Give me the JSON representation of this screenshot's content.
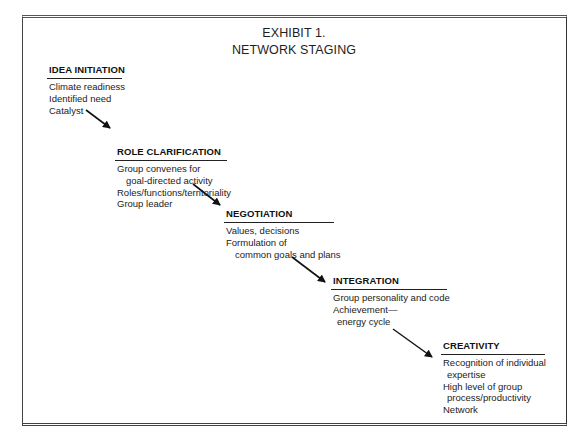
{
  "exhibit": {
    "title_line1": "EXHIBIT 1.",
    "title_line2": "NETWORK STAGING"
  },
  "stages": [
    {
      "heading": "IDEA INITIATION",
      "lines": [
        "Climate readiness",
        "Identified need",
        "Catalyst"
      ]
    },
    {
      "heading": "ROLE CLARIFICATION",
      "lines": [
        "Group convenes for",
        "goal-directed activity",
        "Roles/functions/territoriality",
        "Group leader"
      ]
    },
    {
      "heading": "NEGOTIATION",
      "lines": [
        "Values, decisions",
        "Formulation of",
        "common goals and plans"
      ]
    },
    {
      "heading": "INTEGRATION",
      "lines": [
        "Group personality and code",
        "Achievement—",
        "energy cycle"
      ]
    },
    {
      "heading": "CREATIVITY",
      "lines": [
        "Recognition of individual",
        "expertise",
        "High level of group",
        "process/productivity",
        "Network"
      ]
    }
  ],
  "connectors": [
    {
      "from": "IDEA INITIATION",
      "to": "ROLE CLARIFICATION",
      "icon": "arrow-down-right"
    },
    {
      "from": "ROLE CLARIFICATION",
      "to": "NEGOTIATION",
      "icon": "arrow-down-right"
    },
    {
      "from": "NEGOTIATION",
      "to": "INTEGRATION",
      "icon": "arrow-down-right"
    },
    {
      "from": "INTEGRATION",
      "to": "CREATIVITY",
      "icon": "arrow-down-right"
    }
  ],
  "colors": {
    "ink": "#1a1a1a",
    "border": "#444444",
    "background": "#ffffff"
  }
}
